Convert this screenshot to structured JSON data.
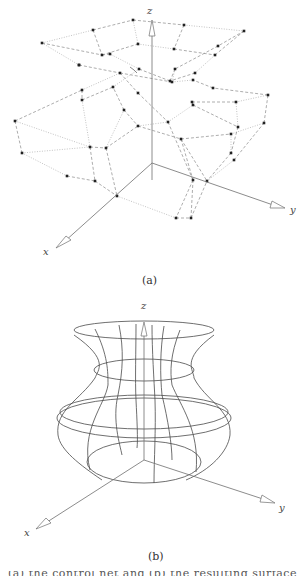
{
  "figure": {
    "panel_a": {
      "caption": "(a)",
      "axis_labels": {
        "x": "x",
        "y": "y",
        "z": "z"
      },
      "description": "control net (dashed wireframe with control points)"
    },
    "panel_b": {
      "caption": "(b)",
      "axis_labels": {
        "x": "x",
        "y": "y",
        "z": "z"
      },
      "description": "vase-shaped surface wireframe"
    },
    "truncated_caption_line": "(a) the control net and (b) the resulting surface"
  }
}
